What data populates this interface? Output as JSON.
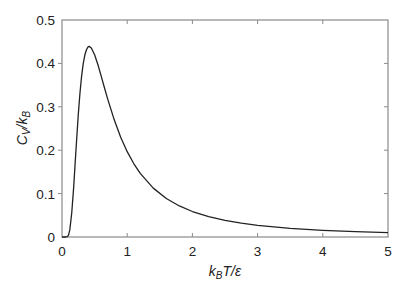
{
  "chart_data": {
    "type": "line",
    "title": "",
    "xlabel": "k_B T/ε",
    "ylabel": "C_V/k_B",
    "xlim": [
      0,
      5
    ],
    "ylim": [
      0,
      0.5
    ],
    "xticks": [
      0,
      1,
      2,
      3,
      4,
      5
    ],
    "yticks": [
      0,
      0.1,
      0.2,
      0.3,
      0.4,
      0.5
    ],
    "xtick_labels": [
      "0",
      "1",
      "2",
      "3",
      "4",
      "5"
    ],
    "ytick_labels": [
      "0",
      "0.1",
      "0.2",
      "0.3",
      "0.4",
      "0.5"
    ],
    "grid": false,
    "legend": null,
    "series": [
      {
        "name": "C_V/k_B",
        "color": "#222222",
        "x": [
          0.0,
          0.05,
          0.08,
          0.1,
          0.12,
          0.15,
          0.18,
          0.2,
          0.225,
          0.25,
          0.275,
          0.3,
          0.325,
          0.35,
          0.375,
          0.4,
          0.417,
          0.45,
          0.5,
          0.55,
          0.6,
          0.65,
          0.7,
          0.8,
          0.9,
          1.0,
          1.1,
          1.2,
          1.4,
          1.6,
          1.8,
          2.0,
          2.25,
          2.5,
          2.75,
          3.0,
          3.5,
          4.0,
          4.5,
          5.0
        ],
        "y": [
          0.0,
          0.0,
          0.0007,
          0.0045,
          0.0164,
          0.0565,
          0.1166,
          0.1662,
          0.2253,
          0.2826,
          0.3307,
          0.3695,
          0.399,
          0.4193,
          0.4315,
          0.4381,
          0.4392,
          0.4356,
          0.42,
          0.3975,
          0.3712,
          0.3445,
          0.3183,
          0.2705,
          0.23,
          0.1966,
          0.1693,
          0.1466,
          0.1126,
          0.0887,
          0.0715,
          0.0587,
          0.0471,
          0.0384,
          0.032,
          0.027,
          0.02,
          0.0154,
          0.0122,
          0.0099
        ]
      }
    ],
    "annotations": [],
    "peak": {
      "x": 0.417,
      "y": 0.439
    }
  },
  "colors": {
    "curve": "#222222",
    "frame": "#8a8a8a",
    "text": "#222222",
    "background": "#ffffff"
  }
}
